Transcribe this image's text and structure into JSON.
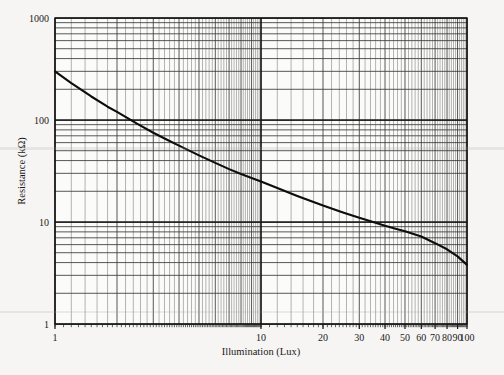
{
  "chart_data": {
    "type": "line",
    "title": "",
    "xlabel": "Illumination (Lux)",
    "ylabel": "Resistance (kΩ)",
    "xscale": "log",
    "yscale": "log",
    "xlim": [
      1,
      100
    ],
    "ylim": [
      1,
      1000
    ],
    "grid": true,
    "legend": "none",
    "x_tick_labels": [
      "1",
      "10",
      "20",
      "30",
      "40",
      "50",
      "60",
      "70",
      "80",
      "90",
      "100"
    ],
    "x_tick_values": [
      1,
      10,
      20,
      30,
      40,
      50,
      60,
      70,
      80,
      90,
      100
    ],
    "y_tick_labels": [
      "1",
      "10",
      "100",
      "1000"
    ],
    "y_tick_values": [
      1,
      10,
      100,
      1000
    ],
    "series": [
      {
        "name": "LDR resistance vs illumination",
        "x": [
          1,
          1.2,
          1.5,
          1.8,
          2,
          2.5,
          3,
          3.5,
          4,
          5,
          6,
          7,
          8,
          9,
          10,
          12,
          15,
          20,
          25,
          30,
          35,
          40,
          45,
          50,
          60,
          70,
          80,
          90,
          100
        ],
        "values": [
          300,
          230,
          170,
          135,
          120,
          92,
          75,
          64,
          56,
          45,
          38,
          33,
          29.5,
          27,
          25,
          21.5,
          18,
          14.5,
          12.4,
          11,
          10,
          9.2,
          8.6,
          8.1,
          7.2,
          6.2,
          5.4,
          4.6,
          3.8
        ]
      }
    ]
  },
  "axes": {
    "y_title": "Resistance (kΩ)",
    "x_title": "Illumination (Lux)"
  },
  "ylabels": {
    "t1000": "1000",
    "t100": "100",
    "t10": "10",
    "t1": "1"
  },
  "xlabels": {
    "l1": "1",
    "l10": "10",
    "l20": "20",
    "l30": "30",
    "l40": "40",
    "l50": "50",
    "l60": "60",
    "l70": "70",
    "l80": "80",
    "l90": "90",
    "l100": "100"
  }
}
